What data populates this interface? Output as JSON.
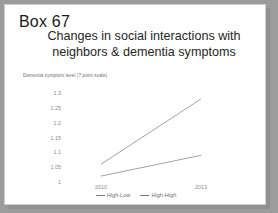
{
  "slide": {
    "box_label": "Box 67",
    "title_line1": "Changes in social interactions with",
    "title_line2": "neighbors & dementia symptoms"
  },
  "chart_data": {
    "type": "line",
    "title": "",
    "ylabel": "Dementia symptom level (7 point scale)",
    "xlabel": "",
    "x": [
      "2010",
      "2013"
    ],
    "categories": [
      "2010",
      "2013"
    ],
    "series": [
      {
        "name": "High-Low",
        "values": [
          1.02,
          1.09
        ],
        "color": "#7a7a7a"
      },
      {
        "name": "High-High",
        "values": [
          1.06,
          1.28
        ],
        "color": "#7a7a7a"
      }
    ],
    "ylim": [
      1.0,
      1.3
    ],
    "yticks": [
      "1.3",
      "1.25",
      "1.2",
      "1.15",
      "1.1",
      "1.05",
      "1"
    ],
    "ytick_values": [
      1.3,
      1.25,
      1.2,
      1.15,
      1.1,
      1.05,
      1.0
    ],
    "xticks": [
      "2010",
      "2013"
    ],
    "grid": false,
    "legend_position": "bottom"
  }
}
